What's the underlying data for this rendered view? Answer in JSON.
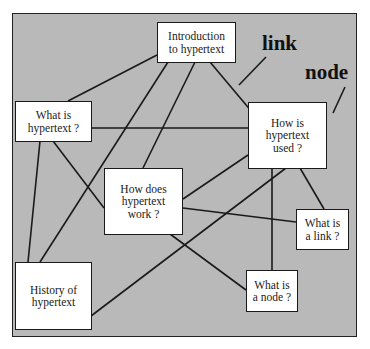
{
  "diagram": {
    "type": "hypertext-network",
    "background_color": "#b9b9b9",
    "node_color": "#ffffff",
    "line_color": "#1a1a1a",
    "nodes": [
      {
        "id": "intro",
        "text": "Introduction\nto hypertext"
      },
      {
        "id": "what_hypertext",
        "text": "What is\nhypertext ?"
      },
      {
        "id": "how_used",
        "text": "How is\nhypertext\nused ?"
      },
      {
        "id": "how_work",
        "text": "How does\nhypertext\nwork ?"
      },
      {
        "id": "history",
        "text": "History of\nhypertext"
      },
      {
        "id": "what_link",
        "text": "What is\na link ?"
      },
      {
        "id": "what_node",
        "text": "What is\na node ?"
      }
    ],
    "edges": [
      [
        "intro",
        "what_hypertext"
      ],
      [
        "intro",
        "history"
      ],
      [
        "intro",
        "how_work"
      ],
      [
        "intro",
        "how_used"
      ],
      [
        "what_hypertext",
        "how_used"
      ],
      [
        "what_hypertext",
        "history"
      ],
      [
        "what_hypertext",
        "how_work"
      ],
      [
        "how_used",
        "how_work"
      ],
      [
        "how_used",
        "what_link"
      ],
      [
        "how_used",
        "what_node"
      ],
      [
        "how_used",
        "history"
      ],
      [
        "how_work",
        "what_link"
      ],
      [
        "how_work",
        "what_node"
      ]
    ],
    "annotations": [
      {
        "id": "link",
        "text": "link"
      },
      {
        "id": "node",
        "text": "node"
      }
    ]
  }
}
